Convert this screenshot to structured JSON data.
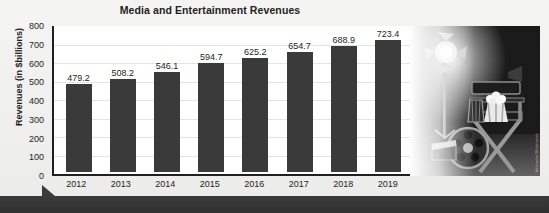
{
  "chart_data": {
    "type": "bar",
    "title": "Media and Entertainment Revenues",
    "xlabel": "",
    "ylabel": "Revenues (in $billions)",
    "categories": [
      "2012",
      "2013",
      "2014",
      "2015",
      "2016",
      "2017",
      "2018",
      "2019"
    ],
    "values": [
      479.2,
      508.2,
      546.1,
      594.7,
      625.2,
      654.7,
      688.9,
      723.4
    ],
    "value_labels": [
      "479.2",
      "508.2",
      "546.1",
      "594.7",
      "625.2",
      "654.7",
      "688.9",
      "723.4"
    ],
    "ylim": [
      0,
      800
    ],
    "yticks": [
      0,
      100,
      200,
      300,
      400,
      500,
      600,
      700,
      800
    ],
    "ytick_labels": [
      "0",
      "100",
      "200",
      "300",
      "400",
      "500",
      "600",
      "700",
      "800"
    ],
    "grid": true,
    "legend": "none",
    "bar_color": "#3a3a3a",
    "axis_color": "#231f20",
    "background_color": "#f2f2f0",
    "plot_background_color": "#ffffff"
  },
  "photo": {
    "alt_name": "film-production-photo",
    "description": "Black and white photo of a director's chair, studio spotlight, film reel, clapperboard and popcorn",
    "credit": "Aleksandar/Shutterstock"
  },
  "footer": {
    "band_color": "#343434"
  }
}
